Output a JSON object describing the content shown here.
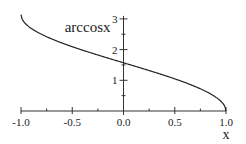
{
  "chart_data": {
    "type": "line",
    "title": "arccosx",
    "xlabel": "x",
    "ylabel": "",
    "xlim": [
      -1.0,
      1.0
    ],
    "ylim": [
      0,
      3.14159
    ],
    "x_ticks": [
      -1.0,
      -0.75,
      -0.5,
      -0.25,
      0.0,
      0.25,
      0.5,
      0.75,
      1.0
    ],
    "x_tick_labels": [
      {
        "value": -1.0,
        "label": "-1.0"
      },
      {
        "value": -0.5,
        "label": "-0.5"
      },
      {
        "value": 0.0,
        "label": "0.0"
      },
      {
        "value": 0.5,
        "label": "0.5"
      },
      {
        "value": 1.0,
        "label": "1.0"
      }
    ],
    "y_ticks": [
      0.5,
      1,
      1.5,
      2,
      2.5,
      3
    ],
    "y_tick_labels": [
      {
        "value": 1,
        "label": "1"
      },
      {
        "value": 2,
        "label": "2"
      },
      {
        "value": 3,
        "label": "3"
      }
    ],
    "series": [
      {
        "name": "arccos(x)",
        "function": "arccos",
        "x_range": [
          -1.0,
          1.0
        ],
        "sample_points": [
          {
            "x": -1.0,
            "y": 3.1416
          },
          {
            "x": -0.5,
            "y": 2.0944
          },
          {
            "x": 0.0,
            "y": 1.5708
          },
          {
            "x": 0.5,
            "y": 1.0472
          },
          {
            "x": 1.0,
            "y": 0.0
          }
        ]
      }
    ],
    "grid": false,
    "legend": "none"
  }
}
